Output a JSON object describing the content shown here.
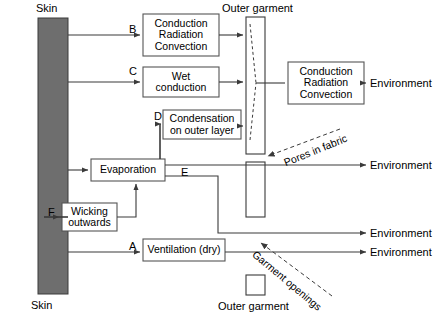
{
  "diagram": {
    "title_top_left": "Skin",
    "title_bottom_left": "Skin",
    "title_top_garment": "Outer garment",
    "title_bottom_garment": "Outer garment",
    "skin_color": "#6e6e6e",
    "line_color": "#3a3a3a",
    "box_border": "#555555",
    "boxes": [
      {
        "id": "b_cond_rad_conv_1",
        "lines": [
          "Conduction",
          "Radiation",
          "Convection"
        ],
        "x": 143,
        "y": 14,
        "w": 76,
        "h": 42
      },
      {
        "id": "b_wet_conduction",
        "lines": [
          "Wet",
          "conduction"
        ],
        "x": 143,
        "y": 67,
        "w": 76,
        "h": 30
      },
      {
        "id": "b_condensation",
        "lines": [
          "Condensation",
          "on outer layer"
        ],
        "x": 163,
        "y": 110,
        "w": 78,
        "h": 29
      },
      {
        "id": "b_evaporation",
        "lines": [
          "Evaporation"
        ],
        "x": 91,
        "y": 159,
        "w": 74,
        "h": 22
      },
      {
        "id": "b_wicking",
        "lines": [
          "Wicking",
          "outwards"
        ],
        "x": 62,
        "y": 203,
        "w": 55,
        "h": 28
      },
      {
        "id": "b_ventilation",
        "lines": [
          "Ventilation (dry)"
        ],
        "x": 143,
        "y": 239,
        "w": 82,
        "h": 22
      },
      {
        "id": "b_cond_rad_conv_2",
        "lines": [
          "Conduction",
          "Radiation",
          "Convection"
        ],
        "x": 288,
        "y": 62,
        "w": 76,
        "h": 42
      }
    ],
    "path_tags": [
      {
        "id": "tag_a",
        "label": "A",
        "x": 129,
        "y": 240
      },
      {
        "id": "tag_b",
        "label": "B",
        "x": 129,
        "y": 25
      },
      {
        "id": "tag_c",
        "label": "C",
        "x": 129,
        "y": 67
      },
      {
        "id": "tag_d",
        "label": "D",
        "x": 155,
        "y": 110
      },
      {
        "id": "tag_e",
        "label": "E",
        "x": 181,
        "y": 166
      },
      {
        "id": "tag_f",
        "label": "F",
        "x": 48,
        "y": 206
      }
    ],
    "environment_labels": [
      {
        "id": "env_1",
        "label": "Environment",
        "x": 370,
        "y": 77
      },
      {
        "id": "env_2",
        "label": "Environment",
        "x": 370,
        "y": 159
      },
      {
        "id": "env_3",
        "label": "Environment",
        "x": 370,
        "y": 226
      },
      {
        "id": "env_4",
        "label": "Environment",
        "x": 370,
        "y": 251
      }
    ],
    "annotations": [
      {
        "id": "ann_pores",
        "label": "Pores in fabric",
        "x": 279,
        "y": 158,
        "rotation": -22
      },
      {
        "id": "ann_openings",
        "label": "Garment openings",
        "x": 255,
        "y": 248,
        "rotation": 40
      }
    ],
    "skin_bar": {
      "x": 38,
      "y": 18,
      "w": 30,
      "h": 276
    },
    "garment_segments": [
      {
        "id": "garment_seg_1",
        "x": 246,
        "y": 17,
        "w": 19,
        "h": 137
      },
      {
        "id": "garment_seg_2",
        "x": 246,
        "y": 162,
        "w": 19,
        "h": 55
      },
      {
        "id": "garment_seg_3",
        "x": 246,
        "y": 275,
        "w": 19,
        "h": 20
      }
    ]
  }
}
